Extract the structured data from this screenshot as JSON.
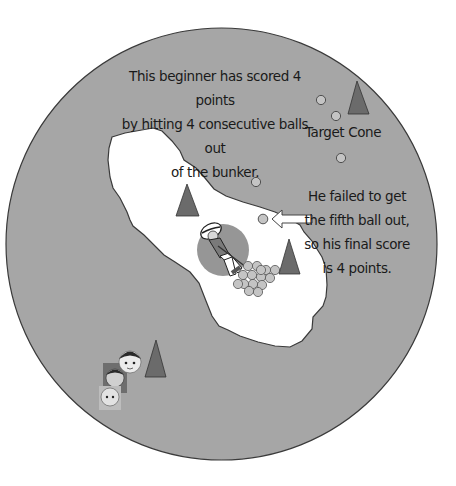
{
  "diagram": {
    "field": {
      "shape": "circle",
      "fill": "#a6a6a6",
      "stroke": "#3a3a3a"
    },
    "bunker": {
      "fill": "#ffffff",
      "stroke": "#3a3a3a"
    },
    "colors": {
      "cone": "#6b6b6b",
      "ball": "#c4c4c4",
      "ball_stroke": "#555555",
      "player_circle": "#969696",
      "arrow_fill": "#ffffff"
    },
    "captions": {
      "top": [
        "This beginner has scored 4 points",
        "by hitting 4 consecutive balls out",
        "of the bunker."
      ],
      "right": [
        "He failed to get",
        "the fifth ball out,",
        "so his final score",
        "is 4 points."
      ],
      "target_cone": "Target Cone"
    },
    "score": {
      "balls_out": 4,
      "failed_ball": 5,
      "final_points": 4
    },
    "elements": {
      "cones": [
        {
          "id": "target-cone",
          "x": 357,
          "y": 82
        },
        {
          "id": "bunker-cone-left",
          "x": 187,
          "y": 186
        },
        {
          "id": "bunker-cone-right",
          "x": 289,
          "y": 241
        },
        {
          "id": "waiting-cone",
          "x": 156,
          "y": 342
        }
      ],
      "balls_out": [
        {
          "x": 321,
          "y": 100
        },
        {
          "x": 336,
          "y": 117
        },
        {
          "x": 341,
          "y": 158
        },
        {
          "x": 256,
          "y": 182
        }
      ],
      "failed_ball": {
        "x": 262,
        "y": 219
      },
      "ball_pile_count": 15,
      "player": {
        "x": 223,
        "y": 248,
        "circle_radius": 26
      },
      "waiting_players": 3
    }
  }
}
